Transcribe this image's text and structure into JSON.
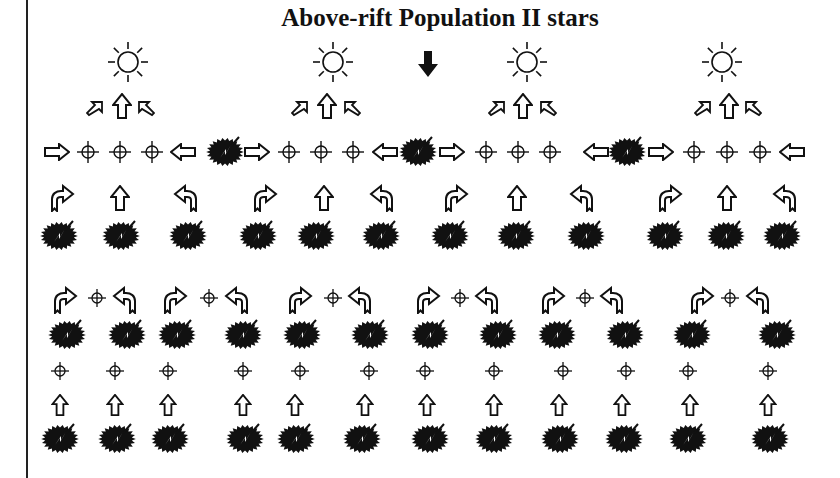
{
  "title": "Above-rift Population II stars",
  "colors": {
    "ink": "#111111",
    "background": "#ffffff"
  },
  "legend_symbols": {
    "sun": "sun-icon (star)",
    "down_arrow": "down-arrow-icon (filled)",
    "burst": "explosion-burst-icon",
    "crosshair": "crosshair-icon",
    "arrows": [
      "right-arrow-icon",
      "left-arrow-icon",
      "up-arrow-icon",
      "diagonal-up-right-arrow-icon",
      "diagonal-up-left-arrow-icon",
      "curved-right-arrow-icon",
      "curved-left-arrow-icon"
    ]
  },
  "top_section": {
    "suns": [
      128,
      333,
      527,
      722
    ],
    "down_arrow": 428,
    "diag_groups": [
      [
        95,
        122,
        146
      ],
      [
        300,
        327,
        352
      ],
      [
        497,
        523,
        548
      ],
      [
        703,
        729,
        753
      ]
    ],
    "horizontal_row": [
      {
        "type": "right",
        "x": 57
      },
      {
        "type": "cross",
        "x": 88
      },
      {
        "type": "cross",
        "x": 120
      },
      {
        "type": "cross",
        "x": 152
      },
      {
        "type": "left",
        "x": 183
      },
      {
        "type": "burst",
        "x": 225
      },
      {
        "type": "right",
        "x": 257
      },
      {
        "type": "cross",
        "x": 289
      },
      {
        "type": "cross",
        "x": 321
      },
      {
        "type": "cross",
        "x": 353
      },
      {
        "type": "left",
        "x": 385
      },
      {
        "type": "burst",
        "x": 418
      },
      {
        "type": "right",
        "x": 452
      },
      {
        "type": "cross",
        "x": 486
      },
      {
        "type": "cross",
        "x": 518
      },
      {
        "type": "cross",
        "x": 550
      },
      {
        "type": "left",
        "x": 596
      },
      {
        "type": "burst",
        "x": 627
      },
      {
        "type": "right",
        "x": 661
      },
      {
        "type": "cross",
        "x": 694
      },
      {
        "type": "cross",
        "x": 727
      },
      {
        "type": "cross",
        "x": 760
      },
      {
        "type": "left",
        "x": 792
      }
    ],
    "ejecta_arrows": [
      {
        "type": "curve-right",
        "x": 62
      },
      {
        "type": "up",
        "x": 120
      },
      {
        "type": "curve-left",
        "x": 186
      },
      {
        "type": "curve-right",
        "x": 265
      },
      {
        "type": "up",
        "x": 324
      },
      {
        "type": "curve-left",
        "x": 382
      },
      {
        "type": "curve-right",
        "x": 456
      },
      {
        "type": "up",
        "x": 517
      },
      {
        "type": "curve-left",
        "x": 582
      },
      {
        "type": "curve-right",
        "x": 670
      },
      {
        "type": "up",
        "x": 727
      },
      {
        "type": "curve-left",
        "x": 785
      }
    ],
    "bursts": [
      59,
      121,
      188,
      258,
      316,
      381,
      450,
      516,
      586,
      665,
      726,
      782
    ]
  },
  "bottom_section": {
    "curve_groups": [
      [
        65,
        97,
        125
      ],
      [
        175,
        209,
        237
      ],
      [
        300,
        333,
        360
      ],
      [
        428,
        460,
        487
      ],
      [
        553,
        585,
        612
      ],
      [
        702,
        730,
        758
      ]
    ],
    "bursts_row1": [
      67,
      127,
      177,
      243,
      302,
      370,
      430,
      498,
      557,
      625,
      692,
      777
    ],
    "crosshairs": [
      60,
      115,
      168,
      243,
      300,
      369,
      425,
      494,
      563,
      626,
      688,
      768
    ],
    "up_arrows": [
      60,
      115,
      168,
      243,
      295,
      365,
      427,
      494,
      559,
      622,
      690,
      768
    ],
    "bursts_row2": [
      60,
      117,
      170,
      245,
      296,
      362,
      430,
      494,
      560,
      624,
      688,
      770
    ]
  }
}
